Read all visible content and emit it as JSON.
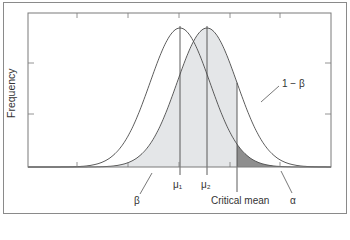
{
  "chart_data": {
    "type": "area",
    "title": "",
    "xlabel": "",
    "ylabel": "Frequency",
    "grid": false,
    "legend": null,
    "series": [
      {
        "name": "Distribution under null (mean μ1)",
        "mean_label": "μ1",
        "mean_px": 180,
        "sd_px": 30
      },
      {
        "name": "Distribution under alternative (mean μ2)",
        "mean_label": "μ2",
        "mean_px": 207,
        "sd_px": 30
      }
    ],
    "x_markers": [
      {
        "label": "μ₁",
        "x_px": 180
      },
      {
        "label": "μ₂",
        "x_px": 207
      },
      {
        "label": "Critical mean",
        "x_px": 237
      }
    ],
    "regions": [
      {
        "label": "β",
        "description": "Area under μ2 curve left of critical mean",
        "fill": "#e4e6e8"
      },
      {
        "label": "α",
        "description": "Area under μ1 curve right of critical mean",
        "fill": "#8e8e8e"
      },
      {
        "label": "1 − β",
        "description": "Area under μ2 curve right of critical mean",
        "fill": "#ffffff"
      }
    ],
    "annotations": [
      {
        "text": "1 − β",
        "x_px": 288,
        "y_px": 86
      },
      {
        "text": "β",
        "x_px": 137,
        "y_px": 202
      },
      {
        "text": "α",
        "x_px": 294,
        "y_px": 202
      }
    ],
    "axes": {
      "plot_left": 28,
      "plot_right": 331,
      "plot_top": 13,
      "baseline": 167,
      "x_ticks_px": [
        77,
        128,
        179,
        230,
        280
      ],
      "y_ticks_px": [
        63,
        114
      ]
    }
  },
  "labels": {
    "ylabel": "Frequency",
    "mu1": "μ₁",
    "mu2": "μ₂",
    "critical": "Critical mean",
    "beta": "β",
    "alpha": "α",
    "one_minus_beta": "1 − β"
  },
  "colors": {
    "beta_fill": "#e4e6e8",
    "alpha_fill": "#8e8e8e",
    "line": "#4a4a4a",
    "axis": "#7a7a7a"
  }
}
